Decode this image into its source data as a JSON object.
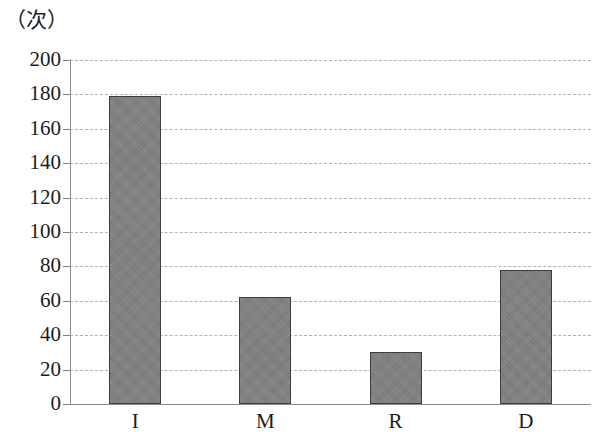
{
  "chart_data": {
    "type": "bar",
    "title": "",
    "subtitle": "",
    "xlabel": "",
    "ylabel": "（次）",
    "y_unit_caption": "（次）",
    "categories": [
      "I",
      "M",
      "R",
      "D"
    ],
    "values": [
      179,
      62,
      30,
      78
    ],
    "series": [
      {
        "name": "",
        "values": [
          179,
          62,
          30,
          78
        ]
      }
    ],
    "ylim": [
      0,
      200
    ],
    "y_ticks": [
      200,
      180,
      160,
      140,
      120,
      100,
      80,
      60,
      40,
      20,
      0
    ],
    "y_tick_labels": [
      "200",
      "180",
      "160",
      "140",
      "120",
      "100",
      "80",
      "60",
      "40",
      "20",
      "0"
    ],
    "y_tick_step": 20,
    "grid": true,
    "grid_style": "dashed",
    "grid_axis": "y",
    "legend": false,
    "legend_position": "none",
    "annotations": [],
    "bar_color": "#808080",
    "bar_edge_color": "#3d3d3d",
    "grid_color": "#b4b4b4",
    "axis_color": "#8a8a8a",
    "text_color": "#1c1c1c",
    "background_color": "#ffffff"
  }
}
